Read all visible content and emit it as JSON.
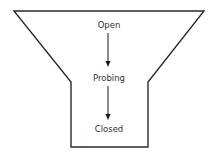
{
  "diagram": {
    "type": "funnel",
    "stages": [
      {
        "label": "Open"
      },
      {
        "label": "Probing"
      },
      {
        "label": "Closed"
      }
    ],
    "colors": {
      "outline": "#2a2a2a",
      "text": "#333333",
      "arrow": "#1a1a1a",
      "background": "#ffffff"
    }
  }
}
